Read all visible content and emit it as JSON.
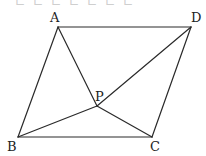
{
  "figure": {
    "type": "parallelogram-with-interior-point",
    "stroke_color": "#2a2a2a",
    "label_color": "#222222",
    "points": {
      "A": {
        "x": 58,
        "y": 27,
        "label": "A",
        "lx": 50,
        "ly": 22
      },
      "D": {
        "x": 191,
        "y": 27,
        "label": "D",
        "lx": 191,
        "ly": 22
      },
      "B": {
        "x": 18,
        "y": 137,
        "label": "B",
        "lx": 7,
        "ly": 151
      },
      "C": {
        "x": 152,
        "y": 137,
        "label": "C",
        "lx": 150,
        "ly": 151
      },
      "P": {
        "x": 97,
        "y": 106,
        "label": "P",
        "lx": 95,
        "ly": 101
      }
    },
    "segments": [
      [
        "A",
        "D"
      ],
      [
        "D",
        "C"
      ],
      [
        "C",
        "B"
      ],
      [
        "B",
        "A"
      ],
      [
        "A",
        "P"
      ],
      [
        "P",
        "C"
      ],
      [
        "B",
        "P"
      ],
      [
        "P",
        "D"
      ]
    ]
  },
  "top_cut_text": "ㄴㄴㄴㄴㄴㄴㄴ"
}
